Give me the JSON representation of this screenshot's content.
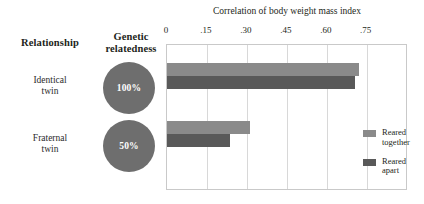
{
  "headers": {
    "relationship": "Relationship",
    "relatedness": "Genetic\nrelatedness"
  },
  "rows": [
    {
      "label": "Identical\ntwin",
      "relatedness": "100%"
    },
    {
      "label": "Fraternal\ntwin",
      "relatedness": "50%"
    }
  ],
  "legend": {
    "together_label": "Reared\ntogether",
    "apart_label": "Reared\napart"
  },
  "colors": {
    "reared_together": "#8a8a8a",
    "reared_apart": "#595959",
    "circle": "#6e6e6e",
    "plot_border": "#c9c9c9",
    "gridline": "#d8d8d8"
  },
  "chart_data": {
    "type": "bar",
    "orientation": "horizontal",
    "title": "Correlation of body weight mass index",
    "xlabel": "",
    "ylabel": "",
    "categories": [
      "Identical twin",
      "Fraternal twin"
    ],
    "series": [
      {
        "name": "Reared together",
        "values": [
          0.72,
          0.31
        ],
        "color": "#8a8a8a"
      },
      {
        "name": "Reared apart",
        "values": [
          0.705,
          0.235
        ],
        "color": "#595959"
      }
    ],
    "xlim": [
      0,
      0.905
    ],
    "xticks": [
      0,
      0.15,
      0.3,
      0.45,
      0.6,
      0.75
    ],
    "xticklabels": [
      "0",
      ".15",
      ".30",
      ".45",
      ".60",
      ".75"
    ],
    "grid": "vertical",
    "legend_position": "inside-right"
  }
}
